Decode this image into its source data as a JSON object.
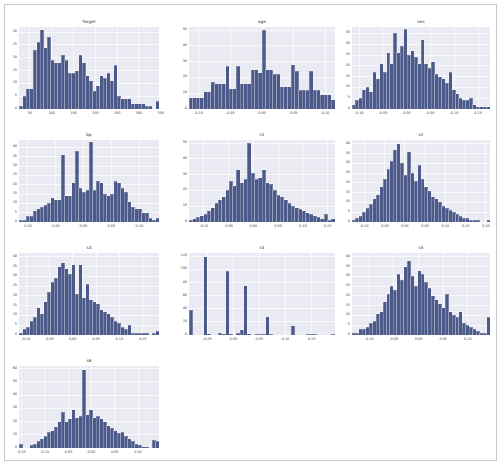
{
  "figure": {
    "background": "#ffffff",
    "border_color": "#c8c8c8",
    "axes_background": "#eaeaf2",
    "grid_color": "#ffffff",
    "bar_color": "#4c5a8a",
    "tick_color": "#3d3d3d",
    "layout": {
      "rows": 4,
      "cols": 3,
      "total_panels": 10
    }
  },
  "chart_data": [
    {
      "type": "bar",
      "title": "Target",
      "xlabel": "",
      "ylabel": "",
      "grid": true,
      "legend": null,
      "xlim": [
        25,
        346
      ],
      "ylim": [
        0,
        32
      ],
      "xticks": [
        50,
        100,
        150,
        200,
        250,
        300,
        350
      ],
      "xtick_labels": [
        "50",
        "100",
        "150",
        "200",
        "250",
        "300",
        "350"
      ],
      "yticks": [
        0,
        5,
        10,
        15,
        20,
        25,
        30
      ],
      "ytick_labels": [
        "0",
        "5",
        "10",
        "15",
        "20",
        "25",
        "30"
      ],
      "bin_count": 40,
      "values": [
        1,
        5,
        8,
        8,
        23,
        26,
        31,
        24,
        28,
        19,
        18,
        18,
        21,
        19,
        14,
        14,
        15,
        21,
        18,
        13,
        11,
        7,
        9,
        13,
        12,
        14,
        11,
        17,
        5,
        4,
        4,
        4,
        2,
        2,
        2,
        2,
        1,
        1,
        0,
        3
      ]
    },
    {
      "type": "bar",
      "title": "age",
      "xlabel": "",
      "ylabel": "",
      "grid": true,
      "legend": null,
      "xlim": [
        -0.115,
        0.115
      ],
      "ylim": [
        0,
        52
      ],
      "xticks": [
        -0.1,
        -0.05,
        0.0,
        0.05,
        0.1
      ],
      "xtick_labels": [
        "-0.10",
        "-0.05",
        "0.00",
        "0.05",
        "0.10"
      ],
      "yticks": [
        0,
        10,
        20,
        30,
        40,
        50
      ],
      "ytick_labels": [
        "0",
        "10",
        "20",
        "30",
        "40",
        "50"
      ],
      "bin_count": 40,
      "values": [
        7,
        7,
        7,
        7,
        11,
        11,
        17,
        16,
        16,
        16,
        27,
        13,
        13,
        27,
        16,
        16,
        16,
        25,
        25,
        23,
        50,
        25,
        25,
        22,
        22,
        14,
        14,
        14,
        28,
        24,
        12,
        12,
        12,
        24,
        12,
        12,
        9,
        9,
        9,
        6
      ]
    },
    {
      "type": "bar",
      "title": "sex",
      "xlabel": "",
      "ylabel": "",
      "grid": true,
      "legend": null,
      "xlim": [
        -0.115,
        0.175
      ],
      "ylim": [
        0,
        38
      ],
      "xticks": [
        -0.1,
        -0.05,
        0.0,
        0.05,
        0.1,
        0.15
      ],
      "xtick_labels": [
        "-0.10",
        "-0.05",
        "0.00",
        "0.05",
        "0.10",
        "0.15"
      ],
      "yticks": [
        0,
        5,
        10,
        15,
        20,
        25,
        30,
        35
      ],
      "ytick_labels": [
        "0",
        "5",
        "10",
        "15",
        "20",
        "25",
        "30",
        "35"
      ],
      "bin_count": 40,
      "values": [
        2,
        4,
        5,
        9,
        10,
        8,
        17,
        14,
        21,
        17,
        26,
        21,
        35,
        26,
        29,
        37,
        25,
        27,
        24,
        21,
        32,
        21,
        19,
        22,
        16,
        15,
        14,
        12,
        17,
        9,
        7,
        5,
        4,
        4,
        5,
        2,
        1,
        1,
        1,
        1
      ]
    },
    {
      "type": "bar",
      "title": "bp",
      "xlabel": "",
      "ylabel": "",
      "grid": true,
      "legend": null,
      "xlim": [
        -0.115,
        0.135
      ],
      "ylim": [
        0,
        44
      ],
      "xticks": [
        -0.1,
        -0.05,
        0.0,
        0.05,
        0.1
      ],
      "xtick_labels": [
        "-0.10",
        "-0.05",
        "0.00",
        "0.05",
        "0.10"
      ],
      "yticks": [
        0,
        5,
        10,
        15,
        20,
        25,
        30,
        35,
        40
      ],
      "ytick_labels": [
        "0",
        "5",
        "10",
        "15",
        "20",
        "25",
        "30",
        "35",
        "40"
      ],
      "bin_count": 40,
      "values": [
        1,
        1,
        3,
        3,
        6,
        7,
        8,
        9,
        10,
        13,
        12,
        12,
        36,
        14,
        14,
        21,
        38,
        18,
        16,
        17,
        43,
        17,
        22,
        21,
        15,
        14,
        15,
        22,
        21,
        18,
        16,
        11,
        8,
        7,
        7,
        5,
        5,
        2,
        1,
        2
      ]
    },
    {
      "type": "bar",
      "title": "s1",
      "xlabel": "",
      "ylabel": "",
      "grid": true,
      "legend": null,
      "xlim": [
        -0.13,
        0.165
      ],
      "ylim": [
        0,
        52
      ],
      "xticks": [
        -0.1,
        -0.05,
        0.0,
        0.05,
        0.1,
        0.15
      ],
      "xtick_labels": [
        "-0.10",
        "-0.05",
        "0.00",
        "0.05",
        "0.10",
        "0.15"
      ],
      "yticks": [
        0,
        10,
        20,
        30,
        40,
        50
      ],
      "ytick_labels": [
        "0",
        "10",
        "20",
        "30",
        "40",
        "50"
      ],
      "bin_count": 40,
      "values": [
        1,
        2,
        3,
        4,
        5,
        7,
        9,
        12,
        14,
        16,
        20,
        26,
        23,
        33,
        25,
        27,
        50,
        31,
        27,
        28,
        33,
        25,
        24,
        20,
        17,
        16,
        14,
        12,
        10,
        9,
        8,
        7,
        6,
        5,
        4,
        3,
        2,
        5,
        1,
        2
      ]
    },
    {
      "type": "bar",
      "title": "s2",
      "xlabel": "",
      "ylabel": "",
      "grid": true,
      "legend": null,
      "xlim": [
        -0.13,
        0.21
      ],
      "ylim": [
        0,
        42
      ],
      "xticks": [
        -0.1,
        -0.05,
        0.0,
        0.05,
        0.1,
        0.15,
        0.2
      ],
      "xtick_labels": [
        "-0.10",
        "-0.05",
        "0.00",
        "0.05",
        "0.10",
        "0.15",
        "0.20"
      ],
      "yticks": [
        0,
        5,
        10,
        15,
        20,
        25,
        30,
        35,
        40
      ],
      "ytick_labels": [
        "0",
        "5",
        "10",
        "15",
        "20",
        "25",
        "30",
        "35",
        "40"
      ],
      "bin_count": 40,
      "values": [
        1,
        2,
        3,
        5,
        7,
        9,
        12,
        14,
        18,
        22,
        27,
        31,
        37,
        40,
        30,
        24,
        36,
        25,
        21,
        29,
        22,
        18,
        16,
        13,
        12,
        10,
        8,
        7,
        6,
        5,
        4,
        3,
        2,
        2,
        1,
        1,
        1,
        0,
        0,
        1
      ]
    },
    {
      "type": "bar",
      "title": "s3",
      "xlabel": "",
      "ylabel": "",
      "grid": true,
      "legend": null,
      "xlim": [
        -0.115,
        0.185
      ],
      "ylim": [
        0,
        42
      ],
      "xticks": [
        -0.1,
        -0.05,
        0.0,
        0.05,
        0.1,
        0.15
      ],
      "xtick_labels": [
        "-0.10",
        "-0.05",
        "0.00",
        "0.05",
        "0.10",
        "0.15"
      ],
      "yticks": [
        0,
        5,
        10,
        15,
        20,
        25,
        30,
        35,
        40
      ],
      "ytick_labels": [
        "0",
        "5",
        "10",
        "15",
        "20",
        "25",
        "30",
        "35",
        "40"
      ],
      "bin_count": 40,
      "values": [
        1,
        3,
        4,
        7,
        9,
        14,
        11,
        17,
        22,
        27,
        29,
        35,
        37,
        34,
        31,
        36,
        21,
        36,
        19,
        26,
        18,
        17,
        16,
        13,
        12,
        11,
        9,
        7,
        6,
        4,
        3,
        5,
        1,
        1,
        1,
        1,
        1,
        0,
        1,
        2
      ]
    },
    {
      "type": "bar",
      "title": "s4",
      "xlabel": "",
      "ylabel": "",
      "grid": true,
      "legend": null,
      "xlim": [
        -0.085,
        0.195
      ],
      "ylim": [
        0,
        125
      ],
      "xticks": [
        -0.05,
        0.0,
        0.05,
        0.1,
        0.15
      ],
      "xtick_labels": [
        "-0.05",
        "0.00",
        "0.05",
        "0.10",
        "0.15"
      ],
      "yticks": [
        0,
        20,
        40,
        60,
        80,
        100,
        120
      ],
      "ytick_labels": [
        "0",
        "20",
        "40",
        "60",
        "80",
        "100",
        "120"
      ],
      "bin_count": 40,
      "values": [
        38,
        0,
        0,
        0,
        119,
        2,
        0,
        0,
        3,
        2,
        97,
        2,
        0,
        3,
        8,
        75,
        2,
        0,
        1,
        1,
        1,
        28,
        1,
        0,
        0,
        0,
        0,
        0,
        14,
        0,
        0,
        0,
        1,
        1,
        1,
        0,
        0,
        0,
        0,
        1
      ]
    },
    {
      "type": "bar",
      "title": "s5",
      "xlabel": "",
      "ylabel": "",
      "grid": true,
      "legend": null,
      "xlim": [
        -0.135,
        0.145
      ],
      "ylim": [
        0,
        42
      ],
      "xticks": [
        -0.1,
        -0.05,
        0.0,
        0.05,
        0.1
      ],
      "xtick_labels": [
        "-0.10",
        "-0.05",
        "0.00",
        "0.05",
        "0.10"
      ],
      "yticks": [
        0,
        5,
        10,
        15,
        20,
        25,
        30,
        35,
        40
      ],
      "ytick_labels": [
        "0",
        "5",
        "10",
        "15",
        "20",
        "25",
        "30",
        "35",
        "40"
      ],
      "bin_count": 40,
      "values": [
        1,
        1,
        3,
        3,
        4,
        6,
        7,
        11,
        12,
        17,
        21,
        25,
        23,
        31,
        28,
        35,
        38,
        30,
        25,
        33,
        31,
        27,
        24,
        20,
        18,
        16,
        14,
        21,
        12,
        10,
        9,
        12,
        6,
        5,
        4,
        3,
        2,
        1,
        1,
        9
      ]
    },
    {
      "type": "bar",
      "title": "s6",
      "xlabel": "",
      "ylabel": "",
      "grid": true,
      "legend": null,
      "xlim": [
        -0.155,
        0.145
      ],
      "ylim": [
        0,
        62
      ],
      "xticks": [
        -0.15,
        -0.1,
        -0.05,
        0.0,
        0.05,
        0.1
      ],
      "xtick_labels": [
        "-0.15",
        "-0.10",
        "-0.05",
        "0.00",
        "0.05",
        "0.10"
      ],
      "yticks": [
        0,
        10,
        20,
        30,
        40,
        50,
        60
      ],
      "ytick_labels": [
        "0",
        "10",
        "20",
        "30",
        "40",
        "50",
        "60"
      ],
      "bin_count": 40,
      "values": [
        3,
        0,
        0,
        2,
        3,
        5,
        7,
        9,
        12,
        13,
        16,
        20,
        27,
        20,
        22,
        29,
        23,
        24,
        59,
        25,
        29,
        23,
        24,
        22,
        20,
        17,
        15,
        13,
        11,
        12,
        9,
        7,
        5,
        3,
        2,
        1,
        1,
        0,
        6,
        5
      ]
    }
  ]
}
